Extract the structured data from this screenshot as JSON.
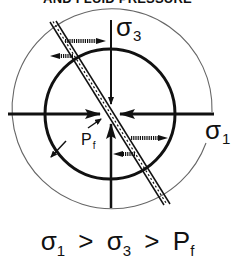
{
  "title": "AND FLUID PRESSURE",
  "labels": {
    "sigma3": {
      "symbol": "σ",
      "subscript": "3"
    },
    "sigma1": {
      "symbol": "σ",
      "subscript": "1"
    },
    "pf": {
      "symbol": "P",
      "subscript": "f"
    }
  },
  "formula": {
    "term1_symbol": "σ",
    "term1_sub": "1",
    "op1": ">",
    "term2_symbol": "σ",
    "term2_sub": "3",
    "op2": ">",
    "term3_symbol": "P",
    "term3_sub": "f"
  },
  "colors": {
    "ink": "#111111",
    "outer_circle": "#666666",
    "background": "#ffffff"
  }
}
